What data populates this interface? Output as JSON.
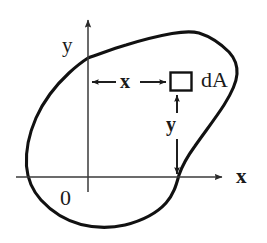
{
  "figure": {
    "type": "engineering-diagram",
    "background_color": "#ffffff",
    "ink_color": "#1a1a1a",
    "axis_color": "#3a3a3a",
    "width": 267,
    "height": 243
  },
  "labels": {
    "axis_y": "y",
    "axis_x": "x",
    "origin": "0",
    "dimension_x": "x",
    "dimension_y": "y",
    "area_element": "dA"
  },
  "geometry": {
    "origin_px": [
      88,
      177
    ],
    "x_axis": {
      "start_px": [
        16,
        177
      ],
      "end_px": [
        228,
        177
      ],
      "arrow": "right"
    },
    "y_axis": {
      "start_px": [
        88,
        192
      ],
      "end_px": [
        88,
        14
      ],
      "arrow": "up"
    },
    "area_element_box_px": {
      "x": 170,
      "y": 72,
      "width": 21,
      "height": 18
    },
    "dimension_x_line_px": {
      "from": [
        89,
        82
      ],
      "to": [
        169,
        82
      ],
      "arrows": "both"
    },
    "dimension_y_line_px": {
      "from": [
        177,
        93
      ],
      "to": [
        177,
        176
      ],
      "arrows": "both"
    },
    "blob_outline_px": [
      [
        88,
        58
      ],
      [
        105,
        52
      ],
      [
        124,
        46
      ],
      [
        143,
        41
      ],
      [
        160,
        37
      ],
      [
        176,
        34
      ],
      [
        190,
        32
      ],
      [
        199,
        33
      ],
      [
        210,
        38
      ],
      [
        222,
        46
      ],
      [
        231,
        55
      ],
      [
        236,
        64
      ],
      [
        237,
        74
      ],
      [
        234,
        86
      ],
      [
        228,
        98
      ],
      [
        219,
        112
      ],
      [
        207,
        128
      ],
      [
        196,
        143
      ],
      [
        187,
        158
      ],
      [
        181,
        170
      ],
      [
        178,
        180
      ],
      [
        174,
        193
      ],
      [
        166,
        205
      ],
      [
        152,
        216
      ],
      [
        136,
        223
      ],
      [
        118,
        227
      ],
      [
        100,
        227
      ],
      [
        84,
        224
      ],
      [
        68,
        218
      ],
      [
        54,
        209
      ],
      [
        42,
        198
      ],
      [
        33,
        186
      ],
      [
        28,
        172
      ],
      [
        26,
        156
      ],
      [
        28,
        138
      ],
      [
        34,
        120
      ],
      [
        43,
        103
      ],
      [
        54,
        88
      ],
      [
        66,
        75
      ],
      [
        78,
        65
      ],
      [
        88,
        58
      ]
    ]
  }
}
